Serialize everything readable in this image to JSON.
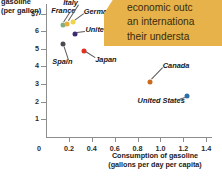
{
  "chart_data": {
    "type": "scatter",
    "title": "",
    "ylabel": "gasoline (per gallon)",
    "ylabel_lines": [
      "gasoline",
      "(per gallon)"
    ],
    "xlabel": "Consumption of gasoline (gallons per day per capita)",
    "xlabel_lines": [
      "Consumption of gasoline",
      "(gallons per day per capita)"
    ],
    "xlim": [
      0,
      1.45
    ],
    "ylim": [
      0,
      7.6
    ],
    "grid": false,
    "legend": "none",
    "y_ticks": [
      "$7",
      "6",
      "5",
      "4",
      "3",
      "2",
      "1"
    ],
    "y_tick_values": [
      7,
      6,
      5,
      4,
      3,
      2,
      1
    ],
    "x_ticks": [
      "0",
      "0.2",
      "0.4",
      "0.6",
      "0.8",
      "1.0",
      "1.2",
      "1.4"
    ],
    "x_tick_values": [
      0,
      0.2,
      0.4,
      0.6,
      0.8,
      1.0,
      1.2,
      1.4
    ],
    "origin_label": "0",
    "points": [
      {
        "name": "France",
        "x": 0.145,
        "y": 6.35,
        "color": "#7fae82",
        "label_x": 0.045,
        "label_y": 7.15,
        "label_align": "left"
      },
      {
        "name": "Italy",
        "x": 0.185,
        "y": 6.42,
        "color": "#e8b03a",
        "label_x": 0.15,
        "label_y": 7.6,
        "label_align": "left"
      },
      {
        "name": "Germany",
        "x": 0.232,
        "y": 6.52,
        "color": "#f0d445",
        "label_x": 0.33,
        "label_y": 7.1,
        "label_align": "left"
      },
      {
        "name": "United Kingdom",
        "x": 0.252,
        "y": 5.87,
        "color": "#3d2b6e",
        "label_x": 0.345,
        "label_y": 6.05,
        "label_align": "left"
      },
      {
        "name": "Spain",
        "x": 0.148,
        "y": 5.28,
        "color": "#4a4a52",
        "label_x": 0.055,
        "label_y": 4.25,
        "label_align": "left"
      },
      {
        "name": "Japan",
        "x": 0.33,
        "y": 4.87,
        "color": "#e03222",
        "label_x": 0.43,
        "label_y": 4.35,
        "label_align": "left"
      },
      {
        "name": "Canada",
        "x": 0.905,
        "y": 3.12,
        "color": "#c96a1e",
        "label_x": 1.02,
        "label_y": 4.0,
        "label_align": "left"
      },
      {
        "name": "United States",
        "x": 1.235,
        "y": 2.32,
        "color": "#2b6fa8",
        "label_x": 0.8,
        "label_y": 2.05,
        "label_align": "left"
      }
    ]
  },
  "callout": {
    "background": "#e8b24a",
    "lines": [
      "economic outc",
      "an internationa",
      "their understa"
    ]
  }
}
